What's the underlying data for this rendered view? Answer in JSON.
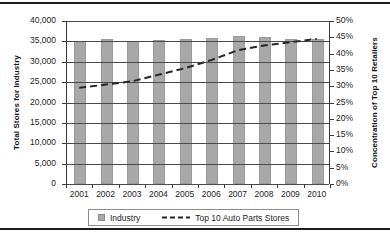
{
  "chart_data": {
    "type": "bar",
    "title": "",
    "categories": [
      "2001",
      "2002",
      "2003",
      "2004",
      "2005",
      "2006",
      "2007",
      "2008",
      "2009",
      "2010"
    ],
    "series": [
      {
        "name": "Industry",
        "type": "bar",
        "axis": "left",
        "values": [
          35000,
          35500,
          35200,
          35400,
          35600,
          35800,
          36300,
          36100,
          35600,
          35500
        ]
      },
      {
        "name": "Top 10 Auto Parts Stores",
        "type": "line",
        "style": "dashed",
        "axis": "right",
        "values": [
          29.5,
          30.5,
          31.5,
          33.5,
          35.5,
          38.0,
          41.0,
          42.5,
          43.5,
          44.5
        ]
      }
    ],
    "xlabel": "",
    "ylabel": "Total Stores for Industry",
    "y2label": "Concentration of Top 10 Retailers",
    "ylim": [
      0,
      40000
    ],
    "y2lim": [
      0,
      50
    ],
    "yticks": [
      "0",
      "5,000",
      "10,000",
      "15,000",
      "20,000",
      "25,000",
      "30,000",
      "35,000",
      "40,000"
    ],
    "y2ticks": [
      "0%",
      "5%",
      "10%",
      "15%",
      "20%",
      "25%",
      "30%",
      "35%",
      "40%",
      "45%",
      "50%"
    ],
    "grid": true,
    "legend_position": "bottom",
    "colors": {
      "bar": "#a8a8a8",
      "line": "#262626",
      "axis": "#3a3a3a",
      "grid": "#4a4a4a",
      "text": "#1c1c1c"
    }
  },
  "legend": {
    "items": [
      {
        "label": "Industry",
        "marker": "bar-swatch-icon"
      },
      {
        "label": "Top 10 Auto Parts Stores",
        "marker": "dashed-line-icon"
      }
    ]
  },
  "axes": {
    "left_title": "Total Stores for Industry",
    "right_title": "Concentration of Top 10 Retailers"
  }
}
